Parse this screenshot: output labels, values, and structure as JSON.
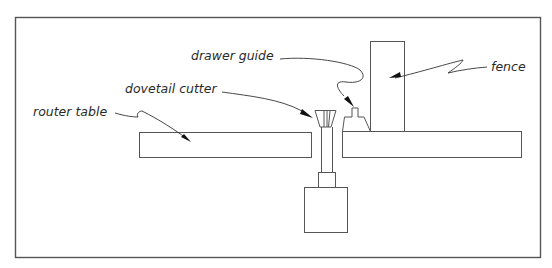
{
  "diagram": {
    "labels": {
      "router_table": "router table",
      "dovetail_cutter": "dovetail cutter",
      "drawer_guide": "drawer guide",
      "fence": "fence"
    }
  }
}
